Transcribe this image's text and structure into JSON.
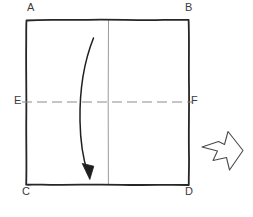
{
  "figure": {
    "background_color": "#ffffff",
    "ink_color": "#262626",
    "light_ink_color": "#8c8c8c",
    "label_color": "#3b3b3b",
    "square": {
      "name": "sheet-square",
      "left": 26,
      "top": 19,
      "right": 189,
      "bottom": 185,
      "stroke_width": 1.8
    },
    "labels": [
      {
        "id": "A",
        "text": "A",
        "corner": "top-left",
        "x": 27,
        "y": 2
      },
      {
        "id": "B",
        "text": "B",
        "corner": "top-right",
        "x": 185,
        "y": 2
      },
      {
        "id": "C",
        "text": "C",
        "corner": "bottom-left",
        "x": 22,
        "y": 186
      },
      {
        "id": "D",
        "text": "D",
        "corner": "bottom-right",
        "x": 185,
        "y": 186
      },
      {
        "id": "E",
        "text": "E",
        "corner": "mid-left",
        "x": 14,
        "y": 95
      },
      {
        "id": "F",
        "text": "F",
        "corner": "mid-right",
        "x": 191,
        "y": 95
      }
    ],
    "dashed_midline": {
      "name": "horizontal-fold-line-EF",
      "y": 102,
      "x1": 22,
      "x2": 192,
      "dash": "10 5",
      "color": "#8c8c8c",
      "stroke_width": 1.2
    },
    "vertical_midline": {
      "name": "vertical-center-line",
      "x": 108,
      "y1": 19,
      "y2": 185,
      "color": "#999999",
      "stroke_width": 1.0
    },
    "fold_arrow": {
      "name": "curved-fold-arrow",
      "start_x": 93,
      "start_y": 38,
      "end_x": 88,
      "end_y": 173,
      "direction": "downward",
      "color": "#1f1f1f"
    },
    "block_arrow": {
      "name": "result-block-arrow",
      "direction": "right",
      "left": 202,
      "top": 131,
      "right": 243,
      "bottom": 170,
      "color": "#4a4a4a",
      "fill": "#ffffff"
    }
  }
}
